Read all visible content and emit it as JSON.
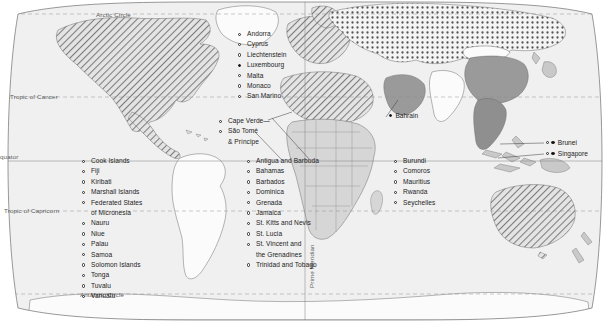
{
  "map": {
    "title": "World map of small states",
    "projection": "robinson",
    "colors": {
      "ocean": "#f0f0f0",
      "land_light": "#e8e8e8",
      "land_mid": "#c9c9c9",
      "land_dark": "#9a9a9a",
      "land_white": "#fbfbfb",
      "outline": "#6e6e6e",
      "graticule": "#8a8a8a",
      "text": "#1c1c1c",
      "grat_text": "#5b5b5b"
    },
    "graticule_labels": [
      {
        "id": "arctic-circle",
        "text": "Arctic Circle",
        "x": 96,
        "y": 11,
        "vertical": false
      },
      {
        "id": "tropic-cancer",
        "text": "Tropic of Cancer",
        "x": 10,
        "y": 93,
        "vertical": false
      },
      {
        "id": "equator",
        "text": "quator",
        "x": 0,
        "y": 153,
        "vertical": false
      },
      {
        "id": "tropic-capricorn",
        "text": "Tropic of Capricorn",
        "x": 4,
        "y": 207,
        "vertical": false
      },
      {
        "id": "antarctic-circle",
        "text": "Antarctic Circle",
        "x": 80,
        "y": 291,
        "vertical": false
      },
      {
        "id": "prime-meridian",
        "text": "Prime Meridian",
        "x": 308,
        "y": 288,
        "vertical": true
      }
    ],
    "label_groups": [
      {
        "id": "europe-microstates",
        "x": 238,
        "y": 29,
        "items": [
          {
            "text": "Andorra",
            "marker": "hollow"
          },
          {
            "text": "Cyprus",
            "marker": "hollow"
          },
          {
            "text": "Liechtenstein",
            "marker": "hollow"
          },
          {
            "text": "Luxembourg",
            "marker": "filled"
          },
          {
            "text": "Malta",
            "marker": "hollow"
          },
          {
            "text": "Monaco",
            "marker": "hollow"
          },
          {
            "text": "San Marino",
            "marker": "hollow"
          }
        ]
      },
      {
        "id": "atlantic-islands",
        "x": 219,
        "y": 116,
        "items": [
          {
            "text": "Cape Verde—",
            "marker": "hollow"
          },
          {
            "text": "São Tomé",
            "marker": "hollow"
          },
          {
            "text": "& Príncipe",
            "marker": "none"
          }
        ]
      },
      {
        "id": "pacific-islands",
        "x": 82,
        "y": 156,
        "items": [
          {
            "text": "Cook Islands",
            "marker": "hollow"
          },
          {
            "text": "Fiji",
            "marker": "hollow"
          },
          {
            "text": "Kiribati",
            "marker": "hollow"
          },
          {
            "text": "Marshall Islands",
            "marker": "hollow"
          },
          {
            "text": "Federated States",
            "marker": "hollow"
          },
          {
            "text": "of Micronesia",
            "marker": "none"
          },
          {
            "text": "Nauru",
            "marker": "hollow"
          },
          {
            "text": "Niue",
            "marker": "hollow"
          },
          {
            "text": "Palau",
            "marker": "hollow"
          },
          {
            "text": "Samoa",
            "marker": "hollow"
          },
          {
            "text": "Solomon Islands",
            "marker": "hollow"
          },
          {
            "text": "Tonga",
            "marker": "hollow"
          },
          {
            "text": "Tuvalu",
            "marker": "hollow"
          },
          {
            "text": "Vanuatu",
            "marker": "hollow"
          }
        ]
      },
      {
        "id": "caribbean-states",
        "x": 247,
        "y": 156,
        "items": [
          {
            "text": "Antigua and Barbuda",
            "marker": "hollow"
          },
          {
            "text": "Bahamas",
            "marker": "hollow"
          },
          {
            "text": "Barbados",
            "marker": "hollow"
          },
          {
            "text": "Dominica",
            "marker": "hollow"
          },
          {
            "text": "Grenada",
            "marker": "hollow"
          },
          {
            "text": "Jamaica",
            "marker": "hollow"
          },
          {
            "text": "St. Kitts and Nevis",
            "marker": "hollow"
          },
          {
            "text": "St. Lucia",
            "marker": "hollow"
          },
          {
            "text": "St. Vincent and",
            "marker": "hollow"
          },
          {
            "text": "the Grenadines",
            "marker": "none"
          },
          {
            "text": "Trinidad and Tobago",
            "marker": "hollow"
          }
        ]
      },
      {
        "id": "africa-indian-ocean-states",
        "x": 394,
        "y": 156,
        "items": [
          {
            "text": "Burundi",
            "marker": "hollow"
          },
          {
            "text": "Comoros",
            "marker": "hollow"
          },
          {
            "text": "Mauritius",
            "marker": "hollow"
          },
          {
            "text": "Rwanda",
            "marker": "hollow"
          },
          {
            "text": "Seychelles",
            "marker": "hollow"
          }
        ]
      }
    ],
    "pins": [
      {
        "id": "bahrain",
        "text": "Bahrain",
        "x": 389,
        "y": 115,
        "markers": [
          "filled"
        ]
      },
      {
        "id": "brunei",
        "text": "Brunei",
        "x": 546,
        "y": 142,
        "markers": [
          "hollow",
          "filled"
        ]
      },
      {
        "id": "singapore",
        "text": "Singapore",
        "x": 546,
        "y": 153,
        "markers": [
          "hollow",
          "filled"
        ]
      }
    ]
  }
}
